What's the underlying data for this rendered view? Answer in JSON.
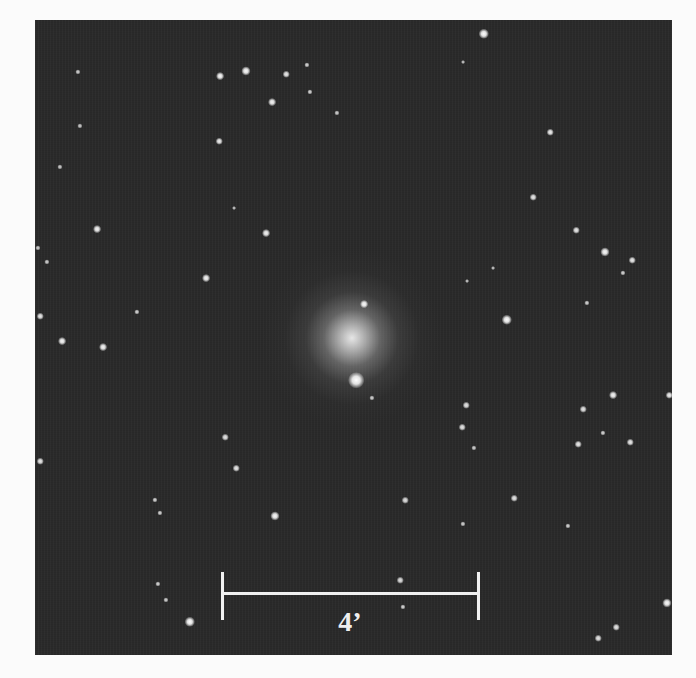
{
  "image": {
    "description": "Astronomical image of an elliptical galaxy surrounded by field stars",
    "background_color": "#2a2a2a",
    "page_color": "#fbfbfb",
    "frame": {
      "left": 35,
      "top": 20,
      "width": 637,
      "height": 635
    }
  },
  "galaxy": {
    "x": 352,
    "y": 338,
    "radius": 70,
    "core_color": "#e8e8e8"
  },
  "scale_bar": {
    "label": "4’",
    "x1": 222,
    "x2": 478,
    "y": 593,
    "tick_top": 572,
    "tick_bottom": 620,
    "label_x": 350,
    "label_y": 608,
    "color": "#f0f0f0"
  },
  "stars": [
    {
      "x": 484,
      "y": 34,
      "r": 4,
      "b": 1.0
    },
    {
      "x": 220,
      "y": 76,
      "r": 3,
      "b": 0.95
    },
    {
      "x": 246,
      "y": 71,
      "r": 3.5,
      "b": 0.95
    },
    {
      "x": 286,
      "y": 74,
      "r": 2.5,
      "b": 0.8
    },
    {
      "x": 307,
      "y": 65,
      "r": 2,
      "b": 0.6
    },
    {
      "x": 78,
      "y": 72,
      "r": 2,
      "b": 0.55
    },
    {
      "x": 272,
      "y": 102,
      "r": 3,
      "b": 0.9
    },
    {
      "x": 310,
      "y": 92,
      "r": 2,
      "b": 0.6
    },
    {
      "x": 337,
      "y": 113,
      "r": 2,
      "b": 0.55
    },
    {
      "x": 463,
      "y": 62,
      "r": 1.5,
      "b": 0.45
    },
    {
      "x": 80,
      "y": 126,
      "r": 2,
      "b": 0.5
    },
    {
      "x": 219,
      "y": 141,
      "r": 2.5,
      "b": 0.85
    },
    {
      "x": 60,
      "y": 167,
      "r": 2,
      "b": 0.5
    },
    {
      "x": 550,
      "y": 132,
      "r": 2.5,
      "b": 0.85
    },
    {
      "x": 97,
      "y": 229,
      "r": 3,
      "b": 0.9
    },
    {
      "x": 266,
      "y": 233,
      "r": 3,
      "b": 0.9
    },
    {
      "x": 206,
      "y": 278,
      "r": 3,
      "b": 0.9
    },
    {
      "x": 533,
      "y": 197,
      "r": 2.5,
      "b": 0.8
    },
    {
      "x": 576,
      "y": 230,
      "r": 2.5,
      "b": 0.8
    },
    {
      "x": 605,
      "y": 252,
      "r": 3.5,
      "b": 0.95
    },
    {
      "x": 632,
      "y": 260,
      "r": 2.5,
      "b": 0.8
    },
    {
      "x": 623,
      "y": 273,
      "r": 2,
      "b": 0.6
    },
    {
      "x": 587,
      "y": 303,
      "r": 2,
      "b": 0.6
    },
    {
      "x": 38,
      "y": 248,
      "r": 2,
      "b": 0.55
    },
    {
      "x": 47,
      "y": 262,
      "r": 2,
      "b": 0.55
    },
    {
      "x": 40,
      "y": 316,
      "r": 2.5,
      "b": 0.8
    },
    {
      "x": 137,
      "y": 312,
      "r": 2,
      "b": 0.6
    },
    {
      "x": 364,
      "y": 304,
      "r": 3,
      "b": 0.95
    },
    {
      "x": 507,
      "y": 320,
      "r": 4,
      "b": 1.0
    },
    {
      "x": 62,
      "y": 341,
      "r": 3,
      "b": 0.9
    },
    {
      "x": 103,
      "y": 347,
      "r": 3,
      "b": 0.9
    },
    {
      "x": 356,
      "y": 380,
      "r": 6,
      "b": 1.0
    },
    {
      "x": 372,
      "y": 398,
      "r": 2,
      "b": 0.55
    },
    {
      "x": 466,
      "y": 405,
      "r": 2.5,
      "b": 0.75
    },
    {
      "x": 613,
      "y": 395,
      "r": 3,
      "b": 0.9
    },
    {
      "x": 669,
      "y": 395,
      "r": 2.5,
      "b": 0.85
    },
    {
      "x": 583,
      "y": 409,
      "r": 2.5,
      "b": 0.75
    },
    {
      "x": 603,
      "y": 433,
      "r": 2,
      "b": 0.6
    },
    {
      "x": 578,
      "y": 444,
      "r": 2.5,
      "b": 0.8
    },
    {
      "x": 630,
      "y": 442,
      "r": 2.5,
      "b": 0.8
    },
    {
      "x": 462,
      "y": 427,
      "r": 2.5,
      "b": 0.75
    },
    {
      "x": 474,
      "y": 448,
      "r": 2,
      "b": 0.55
    },
    {
      "x": 40,
      "y": 461,
      "r": 2.5,
      "b": 0.8
    },
    {
      "x": 225,
      "y": 437,
      "r": 2.5,
      "b": 0.75
    },
    {
      "x": 236,
      "y": 468,
      "r": 2.5,
      "b": 0.8
    },
    {
      "x": 155,
      "y": 500,
      "r": 2,
      "b": 0.6
    },
    {
      "x": 160,
      "y": 513,
      "r": 2,
      "b": 0.6
    },
    {
      "x": 275,
      "y": 516,
      "r": 3.5,
      "b": 0.95
    },
    {
      "x": 405,
      "y": 500,
      "r": 2.5,
      "b": 0.7
    },
    {
      "x": 514,
      "y": 498,
      "r": 2.5,
      "b": 0.75
    },
    {
      "x": 463,
      "y": 524,
      "r": 2,
      "b": 0.55
    },
    {
      "x": 568,
      "y": 526,
      "r": 2,
      "b": 0.6
    },
    {
      "x": 400,
      "y": 580,
      "r": 2.5,
      "b": 0.7
    },
    {
      "x": 403,
      "y": 607,
      "r": 2,
      "b": 0.6
    },
    {
      "x": 158,
      "y": 584,
      "r": 2,
      "b": 0.6
    },
    {
      "x": 166,
      "y": 600,
      "r": 2,
      "b": 0.55
    },
    {
      "x": 190,
      "y": 622,
      "r": 4,
      "b": 1.0
    },
    {
      "x": 667,
      "y": 603,
      "r": 3.5,
      "b": 0.95
    },
    {
      "x": 616,
      "y": 627,
      "r": 2.5,
      "b": 0.75
    },
    {
      "x": 598,
      "y": 638,
      "r": 2.5,
      "b": 0.75
    },
    {
      "x": 493,
      "y": 268,
      "r": 1.5,
      "b": 0.45
    },
    {
      "x": 467,
      "y": 281,
      "r": 1.5,
      "b": 0.45
    },
    {
      "x": 234,
      "y": 208,
      "r": 1.5,
      "b": 0.45
    }
  ]
}
